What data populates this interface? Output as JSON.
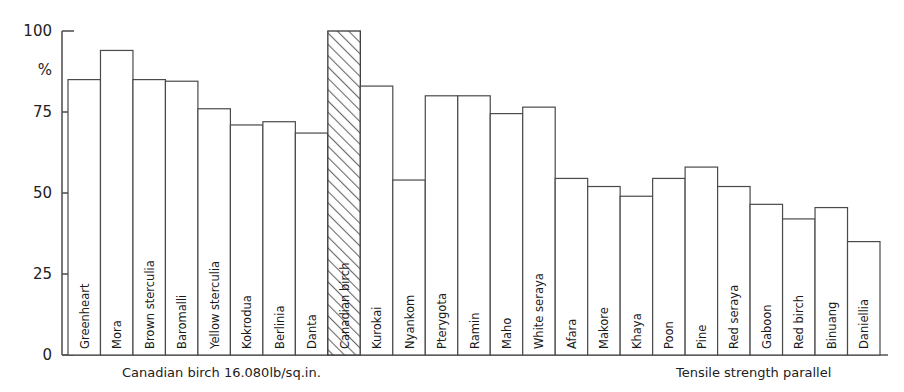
{
  "chart_data": {
    "type": "bar",
    "title": "",
    "subtitle": "",
    "xlabel": "",
    "ylabel": "%",
    "ylim": [
      0,
      100
    ],
    "yticks": [
      0,
      25,
      50,
      75,
      100
    ],
    "ytick_labels": [
      "0",
      "25",
      "50",
      "75",
      "100"
    ],
    "grid": false,
    "legend": null,
    "highlight_category": "Canadian birch",
    "highlight_style": "diagonal-hatch",
    "categories": [
      "Greenheart",
      "Mora",
      "Brown sterculia",
      "Baromalli",
      "Yellow sterculia",
      "Kokrodua",
      "Berlinia",
      "Danta",
      "Canadian birch",
      "Kurokai",
      "Nyankom",
      "Pterygota",
      "Ramin",
      "Maho",
      "White seraya",
      "Afara",
      "Makore",
      "Khaya",
      "Poon",
      "Pine",
      "Red seraya",
      "Gaboon",
      "Red birch",
      "Binuang",
      "Daniellia"
    ],
    "values": [
      85,
      94,
      85,
      84.5,
      76,
      71,
      72,
      68.5,
      100,
      83,
      54,
      80,
      80,
      74.5,
      76.5,
      54.5,
      52,
      49,
      54.5,
      58,
      52,
      46.5,
      42,
      45.5,
      35
    ],
    "annotations": {
      "reference_note": "Canadian birch 16.080lb/sq.in.",
      "chart_caption": "Tensile strength parallel"
    }
  },
  "axis": {
    "y_unit": "%",
    "labels": [
      "100",
      "75",
      "50",
      "25",
      "0"
    ]
  },
  "footer": {
    "left_note": "Canadian birch 16.080lb/sq.in.",
    "right_note": "Tensile strength parallel"
  },
  "colors": {
    "bar_fill": "#ffffff",
    "bar_stroke": "#4a4a4a",
    "axis": "#555555",
    "text": "#1a1a1a",
    "hatch": "#6a6a6a"
  }
}
